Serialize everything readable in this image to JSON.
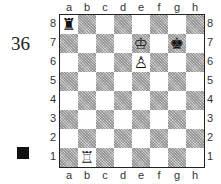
{
  "diagram": {
    "number": "36",
    "side_to_move": "black",
    "turn_marker_color": "#111111"
  },
  "board": {
    "files": [
      "a",
      "b",
      "c",
      "d",
      "e",
      "f",
      "g",
      "h"
    ],
    "ranks": [
      "8",
      "7",
      "6",
      "5",
      "4",
      "3",
      "2",
      "1"
    ],
    "pieces": [
      {
        "square": "a8",
        "color": "black",
        "type": "rook",
        "glyph": "♜"
      },
      {
        "square": "e7",
        "color": "white",
        "type": "king",
        "glyph": "♔"
      },
      {
        "square": "g7",
        "color": "black",
        "type": "king",
        "glyph": "♚"
      },
      {
        "square": "e6",
        "color": "white",
        "type": "pawn",
        "glyph": "♙"
      },
      {
        "square": "b1",
        "color": "white",
        "type": "rook",
        "glyph": "♖"
      }
    ],
    "light_square_color": "#ffffff",
    "dark_square_color": "#cfcfcf"
  }
}
